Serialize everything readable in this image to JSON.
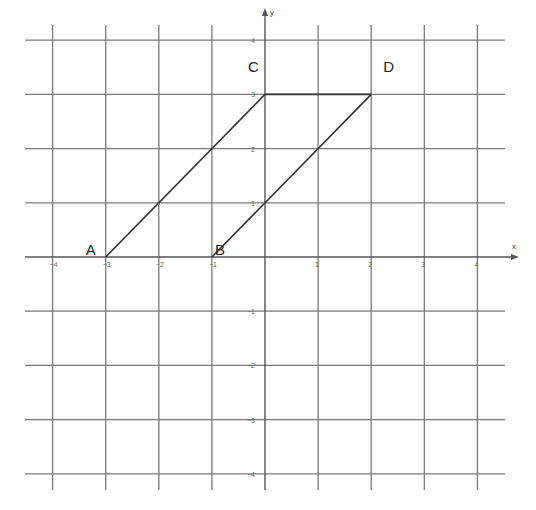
{
  "diagram": {
    "type": "coordinate-plane",
    "axes": {
      "x_label": "x",
      "y_label": "y",
      "x_range": [
        -4,
        4
      ],
      "y_range": [
        -4,
        4
      ],
      "x_ticks": [
        "-4",
        "-3",
        "-2",
        "-1",
        "1",
        "2",
        "3",
        "4"
      ],
      "y_ticks": [
        "4",
        "3",
        "2",
        "1",
        "-1",
        "-2",
        "-3",
        "-4"
      ]
    },
    "points": [
      {
        "label": "A",
        "x": -3,
        "y": 0
      },
      {
        "label": "B",
        "x": -1,
        "y": 0
      },
      {
        "label": "C",
        "x": 0,
        "y": 3
      },
      {
        "label": "D",
        "x": 2,
        "y": 3
      }
    ],
    "segments": [
      {
        "from": "A",
        "to": "C"
      },
      {
        "from": "B",
        "to": "D"
      },
      {
        "from": "C",
        "to": "D"
      }
    ],
    "colors": {
      "grid": "#7a7a7a",
      "shape": "#333333",
      "background": "#ffffff"
    }
  }
}
